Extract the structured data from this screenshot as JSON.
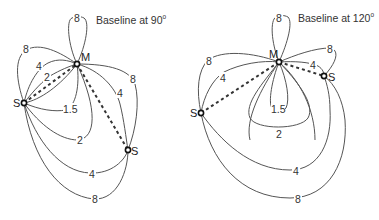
{
  "diagrams": [
    {
      "title": "Baseline at 90",
      "title_sup": "o",
      "baseline_angle_deg": 90,
      "points": {
        "master": "M",
        "slave_left": "S",
        "slave_right": "S"
      },
      "contour_labels": [
        "8",
        "8",
        "4",
        "2",
        "1.5",
        "8",
        "4",
        "2",
        "4",
        "8"
      ]
    },
    {
      "title": "Baseline at 120",
      "title_sup": "o",
      "baseline_angle_deg": 120,
      "points": {
        "master": "M",
        "slave_left": "S",
        "slave_right": "S"
      },
      "contour_labels": [
        "8",
        "8",
        "4",
        "8",
        "4",
        "1.5",
        "2",
        "4",
        "8"
      ]
    }
  ]
}
